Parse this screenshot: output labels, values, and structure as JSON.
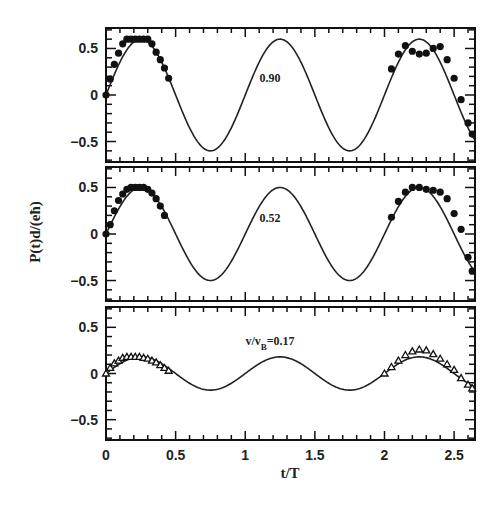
{
  "chart_data": {
    "type": "line",
    "layout": "three vertically stacked panels sharing x-axis",
    "xlabel": "t/T",
    "ylabel": "P(t)d/(eħ)",
    "xlim": [
      0,
      2.65
    ],
    "x_ticks": [
      0,
      0.5,
      1,
      1.5,
      2,
      2.5
    ],
    "x_tick_labels": [
      "0",
      "0.5",
      "1",
      "1.5",
      "2",
      "2.5"
    ],
    "grid": false,
    "panels": [
      {
        "annotation": "0.90",
        "ylim": [
          -0.72,
          0.72
        ],
        "y_ticks": [
          0.5,
          0,
          -0.5
        ],
        "y_tick_labels": [
          "0.5",
          "0",
          "-0.5"
        ],
        "series": [
          {
            "name": "theory",
            "kind": "line",
            "function": "A*sin(2*pi*t)",
            "amplitude": 0.6
          },
          {
            "name": "simulation",
            "kind": "markers",
            "marker": "filled-dot",
            "x": [
              0.0,
              0.03,
              0.06,
              0.09,
              0.12,
              0.15,
              0.18,
              0.21,
              0.24,
              0.27,
              0.3,
              0.33,
              0.36,
              0.39,
              0.42,
              0.45,
              2.05,
              2.1,
              2.15,
              2.2,
              2.25,
              2.3,
              2.35,
              2.4,
              2.45,
              2.5,
              2.55,
              2.6,
              2.63
            ],
            "y": [
              0.0,
              0.17,
              0.33,
              0.45,
              0.55,
              0.6,
              0.6,
              0.6,
              0.6,
              0.6,
              0.6,
              0.55,
              0.46,
              0.38,
              0.29,
              0.18,
              0.28,
              0.44,
              0.53,
              0.47,
              0.44,
              0.45,
              0.5,
              0.52,
              0.38,
              0.18,
              -0.05,
              -0.3,
              -0.42
            ]
          }
        ]
      },
      {
        "annotation": "0.52",
        "ylim": [
          -0.72,
          0.72
        ],
        "y_ticks": [
          0.5,
          0,
          -0.5
        ],
        "y_tick_labels": [
          "0.5",
          "0",
          "-0.5"
        ],
        "series": [
          {
            "name": "theory",
            "kind": "line",
            "function": "A*sin(2*pi*t)",
            "amplitude": 0.5
          },
          {
            "name": "simulation",
            "kind": "markers",
            "marker": "filled-dot",
            "x": [
              0.0,
              0.03,
              0.06,
              0.09,
              0.12,
              0.15,
              0.18,
              0.21,
              0.24,
              0.27,
              0.3,
              0.33,
              0.36,
              0.39,
              0.42,
              2.05,
              2.1,
              2.15,
              2.2,
              2.25,
              2.3,
              2.35,
              2.4,
              2.45,
              2.5,
              2.55,
              2.6,
              2.63
            ],
            "y": [
              0.0,
              0.1,
              0.25,
              0.36,
              0.43,
              0.48,
              0.5,
              0.5,
              0.5,
              0.5,
              0.48,
              0.44,
              0.38,
              0.3,
              0.2,
              0.18,
              0.35,
              0.45,
              0.5,
              0.5,
              0.48,
              0.47,
              0.45,
              0.38,
              0.22,
              0.05,
              -0.25,
              -0.4
            ]
          }
        ]
      },
      {
        "annotation": "v/v_B=0.17",
        "ylim": [
          -0.72,
          0.72
        ],
        "y_ticks": [
          0.5,
          0,
          -0.5
        ],
        "y_tick_labels": [
          "0.5",
          "0",
          "-0.5"
        ],
        "series": [
          {
            "name": "theory",
            "kind": "line",
            "function": "A*sin(2*pi*t)",
            "amplitude": 0.18
          },
          {
            "name": "simulation",
            "kind": "markers",
            "marker": "open-triangle",
            "x": [
              0.0,
              0.03,
              0.06,
              0.09,
              0.12,
              0.15,
              0.18,
              0.21,
              0.24,
              0.27,
              0.3,
              0.33,
              0.36,
              0.39,
              0.42,
              0.45,
              2.0,
              2.05,
              2.1,
              2.15,
              2.2,
              2.25,
              2.3,
              2.35,
              2.4,
              2.45,
              2.5,
              2.55,
              2.6,
              2.63
            ],
            "y": [
              0.0,
              0.06,
              0.11,
              0.14,
              0.17,
              0.18,
              0.18,
              0.18,
              0.18,
              0.17,
              0.16,
              0.14,
              0.12,
              0.09,
              0.06,
              0.03,
              0.0,
              0.07,
              0.14,
              0.2,
              0.24,
              0.26,
              0.25,
              0.21,
              0.16,
              0.1,
              0.04,
              -0.05,
              -0.12,
              -0.16
            ]
          }
        ]
      }
    ]
  }
}
